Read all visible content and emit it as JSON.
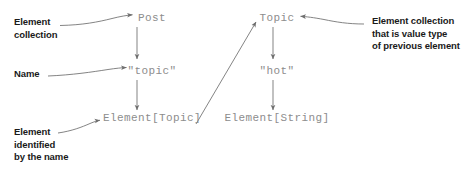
{
  "diagram": {
    "colors": {
      "label_text": "#1a1a1a",
      "code_text": "#8d8d8d",
      "arrow": "#6e6e6e",
      "background": "#ffffff"
    },
    "annotations": [
      {
        "id": "element-collection",
        "text": "Element\ncollection"
      },
      {
        "id": "name",
        "text": "Name"
      },
      {
        "id": "element-identified",
        "text": "Element\nidentified\nby the name"
      },
      {
        "id": "value-type-collection",
        "text": "Element collection\nthat is value type\nof previous element"
      }
    ],
    "column_left": {
      "id": "post-path",
      "nodes": [
        {
          "id": "post",
          "text": "Post"
        },
        {
          "id": "topic-name",
          "text": "\"topic\""
        },
        {
          "id": "element-topic",
          "text": "Element[Topic]"
        }
      ]
    },
    "column_right": {
      "id": "topic-path",
      "nodes": [
        {
          "id": "topic",
          "text": "Topic"
        },
        {
          "id": "hot-name",
          "text": "\"hot\""
        },
        {
          "id": "element-string",
          "text": "Element[String]"
        }
      ]
    },
    "connectors": [
      {
        "id": "curve-element-collection-to-post",
        "kind": "curved-arrow"
      },
      {
        "id": "curve-name-to-topic-name",
        "kind": "curved-arrow"
      },
      {
        "id": "curve-element-identified-to-element-topic",
        "kind": "curved-arrow"
      },
      {
        "id": "curve-value-type-to-topic",
        "kind": "curved-arrow"
      },
      {
        "id": "arrow-post-to-topic-name",
        "kind": "vertical-arrow"
      },
      {
        "id": "arrow-topic-name-to-element-topic",
        "kind": "vertical-arrow"
      },
      {
        "id": "arrow-topic-to-hot-name",
        "kind": "vertical-arrow"
      },
      {
        "id": "arrow-hot-name-to-element-string",
        "kind": "vertical-arrow"
      },
      {
        "id": "arrow-element-topic-to-topic",
        "kind": "diagonal-arrow"
      }
    ]
  }
}
